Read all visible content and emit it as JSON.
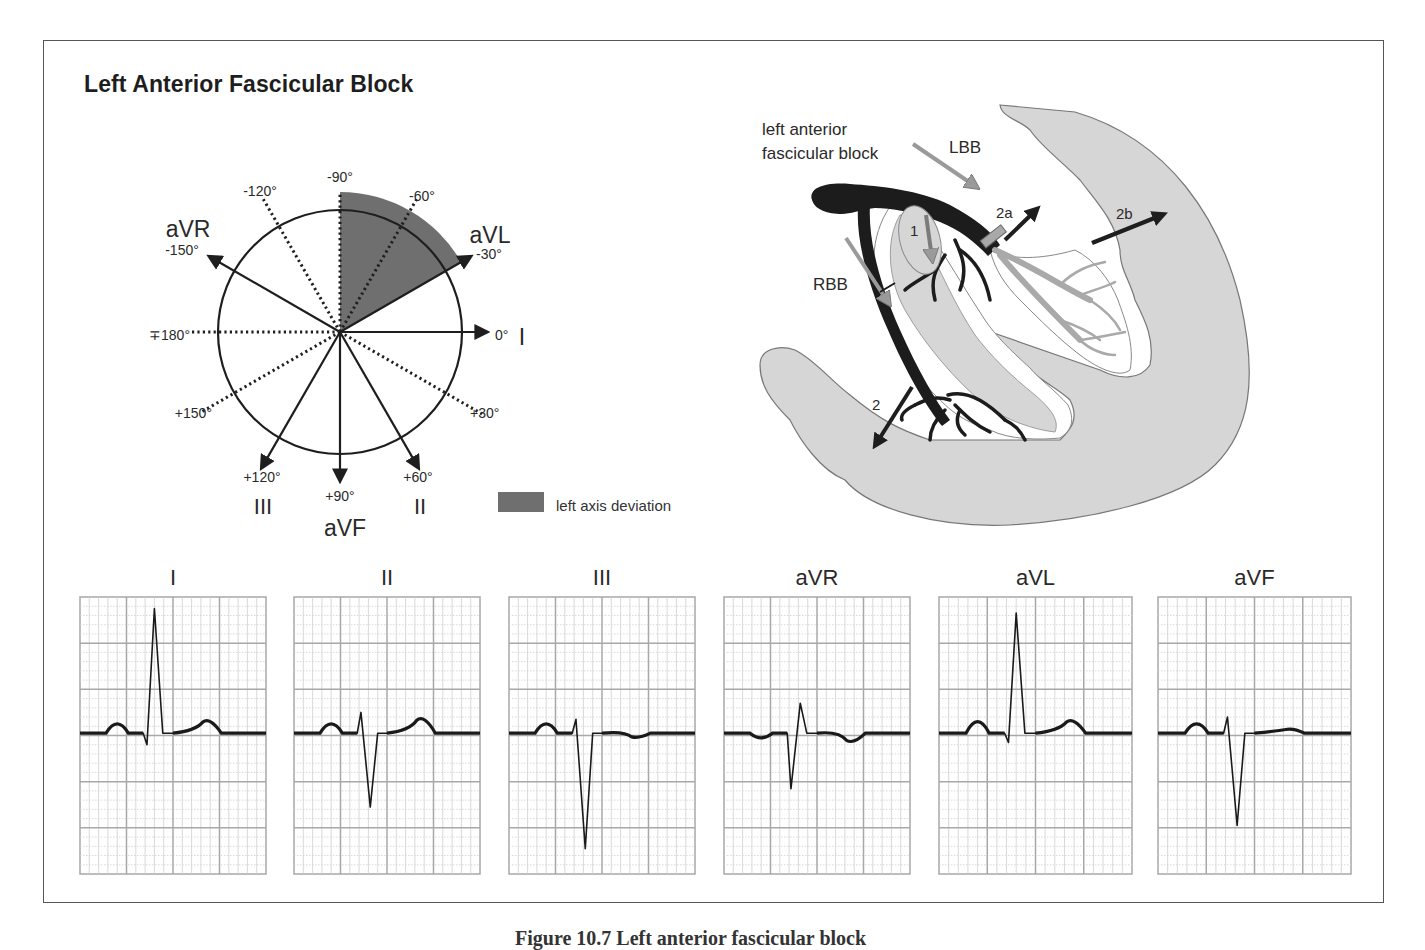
{
  "title": "Left Anterior Fascicular Block",
  "caption_partial": "Figure 10.7  Left anterior fascicular block",
  "colors": {
    "frame": "#555555",
    "shade_lad": "#6f6f6f",
    "heart_fill": "#d6d6d6",
    "conduction_black": "#1c1c1c",
    "conduction_gray": "#a9a9a9",
    "grid_major": "#a8a8a8",
    "grid_minor": "#cfcfcf",
    "trace": "#1a1a1a"
  },
  "hexaxial": {
    "center": [
      340,
      332
    ],
    "radius": 122,
    "solid_axes": [
      {
        "lead": "I",
        "angle": 0,
        "label": "0°",
        "lead_label": "I"
      },
      {
        "lead": "aVL",
        "angle": -30,
        "label": "-30°",
        "lead_label": "aVL"
      },
      {
        "lead": "II",
        "angle": 60,
        "label": "+60°",
        "lead_label": "II"
      },
      {
        "lead": "aVF",
        "angle": 90,
        "label": "+90°",
        "lead_label": "aVF"
      },
      {
        "lead": "III",
        "angle": 120,
        "label": "+120°",
        "lead_label": "III"
      },
      {
        "lead": "aVR",
        "angle": -150,
        "label": "-150°",
        "lead_label": "aVR"
      }
    ],
    "dotted_axes": [
      {
        "angle": -90,
        "label": "-90°"
      },
      {
        "angle": -60,
        "label": "-60°"
      },
      {
        "angle": -120,
        "label": "-120°"
      },
      {
        "angle": 180,
        "label": "∓180°"
      },
      {
        "angle": 150,
        "label": "+150°"
      },
      {
        "angle": 30,
        "label": "+30°"
      }
    ],
    "shaded_sector": {
      "from": -90,
      "to": -30
    }
  },
  "legend": {
    "label": "left axis deviation"
  },
  "heart": {
    "labels": {
      "block": [
        "left anterior",
        "fascicular block"
      ],
      "lbb": "LBB",
      "rbb": "RBB",
      "n1": "1",
      "n2": "2",
      "n2a": "2a",
      "n2b": "2b"
    }
  },
  "chart_data": {
    "type": "line",
    "leads": [
      {
        "name": "I",
        "p": 0.2,
        "q": -0.25,
        "r": 2.7,
        "s": 0,
        "t": 0.3
      },
      {
        "name": "II",
        "p": 0.2,
        "r": 0.45,
        "s": -1.6,
        "t": 0.35
      },
      {
        "name": "III",
        "p": 0.2,
        "r": 0.3,
        "s": -2.5,
        "t": -0.1
      },
      {
        "name": "aVR",
        "p": -0.1,
        "q": -1.2,
        "r": 0.65,
        "t": -0.2
      },
      {
        "name": "aVL",
        "p": 0.25,
        "q": -0.2,
        "r": 2.6,
        "t": 0.3
      },
      {
        "name": "aVF",
        "p": 0.2,
        "r": 0.35,
        "s": -2.0,
        "t": 0.1
      }
    ],
    "grid": {
      "major_cols": 4,
      "major_rows": 6,
      "minor_per_major": 5
    }
  },
  "ecg_strips": [
    {
      "label": "I",
      "x": 80,
      "w": 186
    },
    {
      "label": "II",
      "x": 294,
      "w": 186
    },
    {
      "label": "III",
      "x": 509,
      "w": 186
    },
    {
      "label": "aVR",
      "x": 724,
      "w": 186
    },
    {
      "label": "aVL",
      "x": 939,
      "w": 193
    },
    {
      "label": "aVF",
      "x": 1158,
      "w": 193
    }
  ]
}
